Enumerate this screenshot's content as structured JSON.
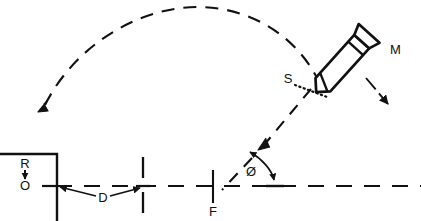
{
  "diagram": {
    "background_color": "#ffffff",
    "stroke_color": "#111111",
    "labels": {
      "munition": "M",
      "sensor": "S",
      "range": "R",
      "origin": "O",
      "distance": "D",
      "fuze": "F",
      "angle": "Ø"
    },
    "elements": {
      "trajectory_arc_name": "trajectory-arc",
      "ground_line_name": "ground-reference-line",
      "target_box_name": "target-box",
      "projectile_name": "projectile-body",
      "descent_arrow_name": "descent-direction-arrow",
      "impact_arrow_name": "impact-direction-arrow",
      "angle_arc_name": "angle-arc",
      "distance_dimension_name": "distance-dimension"
    }
  }
}
